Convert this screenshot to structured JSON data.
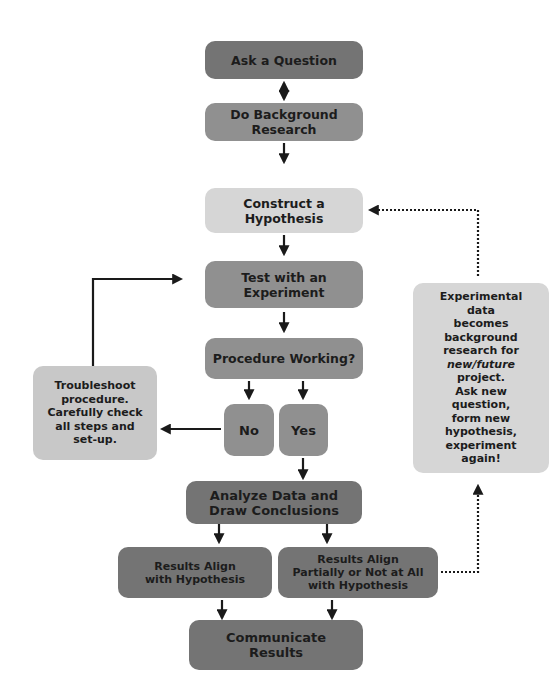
{
  "diagram": {
    "colors": {
      "dark": "#747474",
      "mid": "#909090",
      "light": "#c8c8c8",
      "pale": "#d6d6d6",
      "arrow": "#1a1a1a"
    },
    "nodes": {
      "ask_question": "Ask a Question",
      "background_research": "Do Background\nResearch",
      "hypothesis": "Construct a\nHypothesis",
      "experiment": "Test with an\nExperiment",
      "procedure_working": "Procedure Working?",
      "no": "No",
      "yes": "Yes",
      "troubleshoot": "Troubleshoot\nprocedure.\nCarefully check\nall steps and\nset-up.",
      "analyze": "Analyze Data and\nDraw Conclusions",
      "results_align": "Results Align\nwith Hypothesis",
      "results_partial": "Results Align\nPartially or Not at All\nwith Hypothesis",
      "communicate": "Communicate\nResults",
      "feedback": {
        "line1": "Experimental\ndata\nbecomes\nbackground\nresearch for",
        "italic": "new/future",
        "line2": "project.\nAsk new\nquestion,\nform new\nhypothesis,\nexperiment\nagain!"
      }
    },
    "edges": [
      {
        "from": "ask_question",
        "to": "background_research",
        "style": "solid",
        "bidirectional": true
      },
      {
        "from": "background_research",
        "to": "hypothesis",
        "style": "solid"
      },
      {
        "from": "hypothesis",
        "to": "experiment",
        "style": "solid"
      },
      {
        "from": "experiment",
        "to": "procedure_working",
        "style": "solid"
      },
      {
        "from": "procedure_working",
        "to": "no",
        "style": "solid"
      },
      {
        "from": "procedure_working",
        "to": "yes",
        "style": "solid"
      },
      {
        "from": "no",
        "to": "troubleshoot",
        "style": "solid"
      },
      {
        "from": "troubleshoot",
        "to": "experiment",
        "style": "solid"
      },
      {
        "from": "yes",
        "to": "analyze",
        "style": "solid"
      },
      {
        "from": "analyze",
        "to": "results_align",
        "style": "solid"
      },
      {
        "from": "analyze",
        "to": "results_partial",
        "style": "solid"
      },
      {
        "from": "results_align",
        "to": "communicate",
        "style": "solid"
      },
      {
        "from": "results_partial",
        "to": "communicate",
        "style": "solid"
      },
      {
        "from": "results_partial",
        "to": "feedback",
        "style": "dotted"
      },
      {
        "from": "feedback",
        "to": "hypothesis",
        "style": "dotted"
      }
    ]
  }
}
